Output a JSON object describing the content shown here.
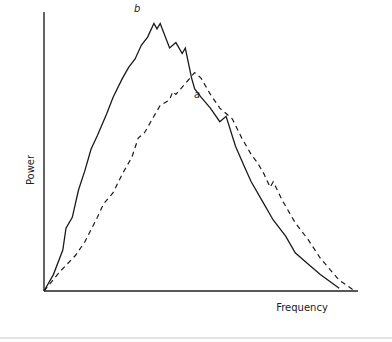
{
  "chart_data": {
    "type": "line",
    "title": "",
    "xlabel": "Frequency",
    "ylabel": "Power",
    "grid": false,
    "legend": "none (inline curve labels)",
    "xlim": [
      0,
      1
    ],
    "ylim": [
      0,
      1
    ],
    "x_ticks": [],
    "y_ticks": [],
    "series": [
      {
        "name": "b",
        "style": "solid",
        "label_position": "above peak",
        "points": [
          [
            0.0,
            0.0
          ],
          [
            0.03,
            0.06
          ],
          [
            0.06,
            0.15
          ],
          [
            0.07,
            0.23
          ],
          [
            0.09,
            0.27
          ],
          [
            0.11,
            0.37
          ],
          [
            0.13,
            0.44
          ],
          [
            0.15,
            0.52
          ],
          [
            0.17,
            0.57
          ],
          [
            0.2,
            0.65
          ],
          [
            0.22,
            0.71
          ],
          [
            0.25,
            0.78
          ],
          [
            0.27,
            0.82
          ],
          [
            0.29,
            0.85
          ],
          [
            0.31,
            0.9
          ],
          [
            0.33,
            0.93
          ],
          [
            0.35,
            0.98
          ],
          [
            0.36,
            0.96
          ],
          [
            0.37,
            0.98
          ],
          [
            0.4,
            0.89
          ],
          [
            0.42,
            0.91
          ],
          [
            0.44,
            0.87
          ],
          [
            0.45,
            0.89
          ],
          [
            0.47,
            0.78
          ],
          [
            0.48,
            0.74
          ],
          [
            0.5,
            0.71
          ],
          [
            0.53,
            0.67
          ],
          [
            0.56,
            0.62
          ],
          [
            0.58,
            0.64
          ],
          [
            0.61,
            0.53
          ],
          [
            0.64,
            0.45
          ],
          [
            0.66,
            0.4
          ],
          [
            0.7,
            0.32
          ],
          [
            0.73,
            0.26
          ],
          [
            0.77,
            0.2
          ],
          [
            0.8,
            0.14
          ],
          [
            0.84,
            0.1
          ],
          [
            0.88,
            0.06
          ],
          [
            0.94,
            0.01
          ]
        ]
      },
      {
        "name": "a",
        "style": "dashed",
        "label_position": "right of peak",
        "points": [
          [
            0.0,
            0.0
          ],
          [
            0.05,
            0.07
          ],
          [
            0.1,
            0.13
          ],
          [
            0.13,
            0.18
          ],
          [
            0.17,
            0.27
          ],
          [
            0.19,
            0.32
          ],
          [
            0.22,
            0.36
          ],
          [
            0.25,
            0.43
          ],
          [
            0.28,
            0.49
          ],
          [
            0.3,
            0.56
          ],
          [
            0.32,
            0.58
          ],
          [
            0.35,
            0.64
          ],
          [
            0.37,
            0.68
          ],
          [
            0.4,
            0.7
          ],
          [
            0.41,
            0.73
          ],
          [
            0.42,
            0.72
          ],
          [
            0.45,
            0.76
          ],
          [
            0.48,
            0.8
          ],
          [
            0.5,
            0.78
          ],
          [
            0.53,
            0.72
          ],
          [
            0.56,
            0.67
          ],
          [
            0.6,
            0.63
          ],
          [
            0.63,
            0.56
          ],
          [
            0.66,
            0.5
          ],
          [
            0.68,
            0.47
          ],
          [
            0.7,
            0.43
          ],
          [
            0.72,
            0.38
          ],
          [
            0.73,
            0.4
          ],
          [
            0.76,
            0.33
          ],
          [
            0.8,
            0.25
          ],
          [
            0.84,
            0.19
          ],
          [
            0.88,
            0.12
          ],
          [
            0.91,
            0.08
          ],
          [
            0.94,
            0.04
          ],
          [
            0.99,
            0.0
          ]
        ]
      }
    ]
  },
  "labels": {
    "series_b": "b",
    "series_a": "a",
    "x_axis": "Frequency",
    "y_axis": "Power"
  },
  "colors": {
    "line": "#1a1a1a",
    "axis": "#222222",
    "divider": "#e4e4e4"
  }
}
